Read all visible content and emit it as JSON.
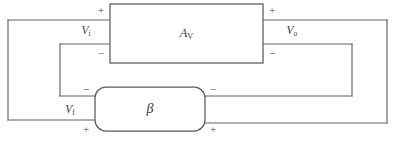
{
  "diagram": {
    "type": "feedback-amplifier-block-diagram",
    "canvas": {
      "width": 394,
      "height": 149,
      "background": "#ffffff"
    },
    "colors": {
      "wire_stroke": "#666163",
      "box_stroke": "#5d5a5b",
      "box_fill": "#ffffff",
      "text": "#3b3839"
    },
    "blocks": [
      {
        "id": "amplifier",
        "name": "amplifier-block",
        "label_base": "A",
        "label_sub": "V",
        "shape": "rectangle",
        "x": 110,
        "y": 4,
        "width": 153,
        "height": 59
      },
      {
        "id": "feedback",
        "name": "feedback-block",
        "label_base": "β",
        "label_sub": "",
        "shape": "rounded-rectangle",
        "x": 95,
        "y": 87,
        "width": 110,
        "height": 44,
        "corner_radius": 11
      }
    ],
    "signals": [
      {
        "id": "input-voltage",
        "name": "input-voltage-label",
        "base": "V",
        "sub": "i",
        "x": 86,
        "y": 31
      },
      {
        "id": "output-voltage",
        "name": "output-voltage-label",
        "base": "V",
        "sub": "o",
        "x": 292,
        "y": 31
      },
      {
        "id": "feedback-voltage",
        "name": "feedback-voltage-label",
        "base": "V",
        "sub": "f",
        "x": 70,
        "y": 110
      }
    ],
    "polarity_marks": [
      {
        "id": "amp-in-plus",
        "name": "amplifier-input-plus-sign",
        "sign": "+",
        "x": 101,
        "y": 11
      },
      {
        "id": "amp-in-minus",
        "name": "amplifier-input-minus-sign",
        "sign": "−",
        "x": 101,
        "y": 54
      },
      {
        "id": "amp-out-plus",
        "name": "amplifier-output-plus-sign",
        "sign": "+",
        "x": 272,
        "y": 11
      },
      {
        "id": "amp-out-minus",
        "name": "amplifier-output-minus-sign",
        "sign": "−",
        "x": 272,
        "y": 54
      },
      {
        "id": "fb-in-minus",
        "name": "feedback-left-minus-sign",
        "sign": "−",
        "x": 86,
        "y": 90
      },
      {
        "id": "fb-in-plus",
        "name": "feedback-left-plus-sign",
        "sign": "+",
        "x": 86,
        "y": 130
      },
      {
        "id": "fb-out-minus",
        "name": "feedback-right-minus-sign",
        "sign": "−",
        "x": 213,
        "y": 90
      },
      {
        "id": "fb-out-plus",
        "name": "feedback-right-plus-sign",
        "sign": "+",
        "x": 213,
        "y": 130
      }
    ],
    "wires": [
      {
        "id": "outer-loop-top-left",
        "name": "wire-source-top",
        "d": "M 8 20 L 110 20"
      },
      {
        "id": "outer-loop-left",
        "name": "wire-source-left-vertical",
        "d": "M 8 20 L 8 120"
      },
      {
        "id": "outer-loop-bottom-left",
        "name": "wire-source-bottom",
        "d": "M 8 120 L 95 120"
      },
      {
        "id": "amp-in-bottom",
        "name": "wire-amp-input-negative",
        "d": "M 60 44 L 110 44"
      },
      {
        "id": "inner-left-vertical",
        "name": "wire-amp-input-to-feedback",
        "d": "M 60 44 L 60 96"
      },
      {
        "id": "fb-in-top",
        "name": "wire-feedback-input-top",
        "d": "M 60 96 L 95 96"
      },
      {
        "id": "amp-out-top",
        "name": "wire-amp-output-top",
        "d": "M 263 20 L 387 20"
      },
      {
        "id": "outer-loop-right",
        "name": "wire-load-right-vertical",
        "d": "M 387 20 L 387 123"
      },
      {
        "id": "outer-loop-bottom-right",
        "name": "wire-load-bottom",
        "d": "M 387 123 L 205 123"
      },
      {
        "id": "amp-out-bottom",
        "name": "wire-amp-output-bottom",
        "d": "M 263 44 L 352 44"
      },
      {
        "id": "inner-right-vertical",
        "name": "wire-output-to-feedback",
        "d": "M 352 44 L 352 96"
      },
      {
        "id": "fb-out-top",
        "name": "wire-feedback-output-top",
        "d": "M 352 96 L 205 96"
      }
    ]
  }
}
